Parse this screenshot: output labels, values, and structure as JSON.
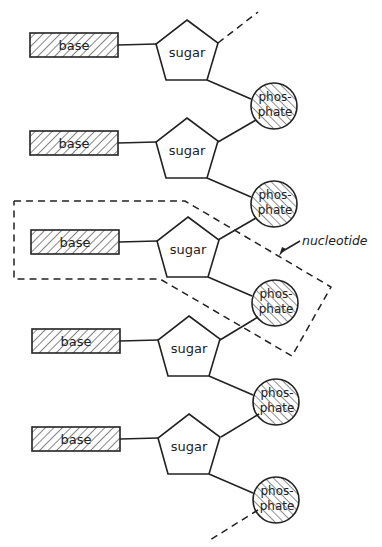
{
  "diagram": {
    "type": "nucleic-acid-strand",
    "colors": {
      "ink": "#222222",
      "background": "#ffffff"
    },
    "units": [
      {
        "base": "base",
        "sugar": "sugar",
        "phosphate_1": "phos-",
        "phosphate_2": "phate"
      },
      {
        "base": "base",
        "sugar": "sugar",
        "phosphate_1": "phos-",
        "phosphate_2": "phate"
      },
      {
        "base": "base",
        "sugar": "sugar",
        "phosphate_1": "phos-",
        "phosphate_2": "phate"
      },
      {
        "base": "base",
        "sugar": "sugar",
        "phosphate_1": "phos-",
        "phosphate_2": "phate"
      },
      {
        "base": "base",
        "sugar": "sugar",
        "phosphate_1": "phos-",
        "phosphate_2": "phate"
      }
    ],
    "annotation": {
      "label": "nucleotide",
      "highlighted_unit_index": 2
    }
  }
}
